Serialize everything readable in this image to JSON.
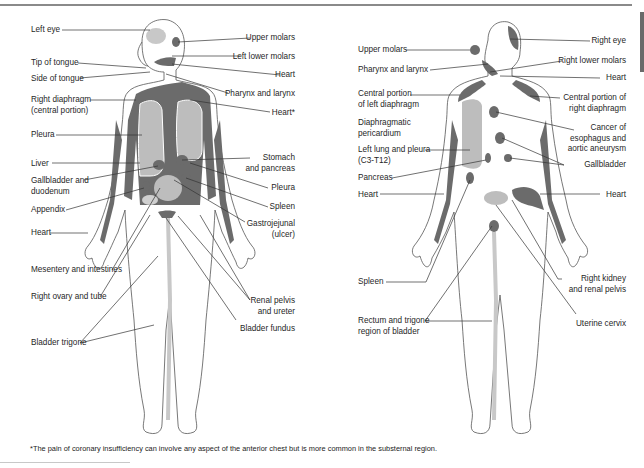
{
  "diagram": {
    "colors": {
      "dark_area": "#6b6b6b",
      "light_area": "#bdbdbd",
      "outline": "#555555",
      "leader": "#333333",
      "rule": "#8a8a8a"
    },
    "front_figure": {
      "left_labels": [
        "Left eye",
        "Tip of tongue",
        "Side of tongue",
        "Right diaphragm\n(central portion)",
        "Pleura",
        "Liver",
        "Gallbladder and\nduodenum",
        "Appendix",
        "Heart",
        "Mesentery and intestines",
        "Right ovary and tube",
        "Bladder trigone"
      ],
      "right_labels": [
        "Upper molars",
        "Left lower molars",
        "Heart",
        "Pharynx and larynx",
        "Heart*",
        "Stomach\nand pancreas",
        "Pleura",
        "Spleen",
        "Gastrojejunal\n(ulcer)",
        "Renal pelvis\nand ureter",
        "Bladder fundus"
      ]
    },
    "back_figure": {
      "left_labels": [
        "Upper molars",
        "Pharynx and larynx",
        "Central portion\nof left diaphragm",
        "Diaphragmatic\npericardium",
        "Left lung and pleura\n(C3-T12)",
        "Pancreas",
        "Heart",
        "Spleen",
        "Rectum and trigone\nregion of bladder"
      ],
      "right_labels": [
        "Right eye",
        "Right lower molars",
        "Heart",
        "Central portion of\nright diaphragm",
        "Cancer of\nesophagus and\naortic aneurysm",
        "Gallbladder",
        "Heart",
        "Right kidney\nand renal pelvis",
        "Uterine cervix"
      ]
    },
    "footnote": "*The pain of coronary insufficiency can involve any aspect of the anterior chest but is more common in the substernal region."
  }
}
